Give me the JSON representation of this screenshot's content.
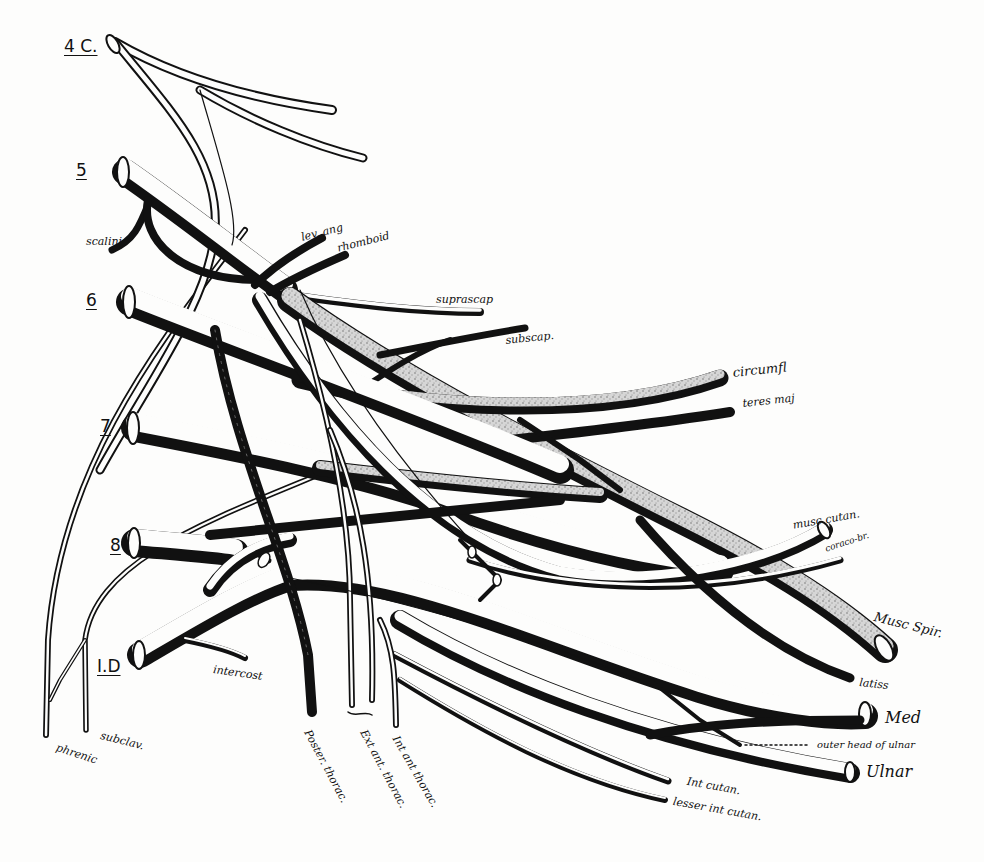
{
  "figure": {
    "colors": {
      "ink": "#111111",
      "paper": "#fdfdfc",
      "stipple": "#b8b8b8"
    }
  },
  "roots": [
    {
      "id": "c4",
      "label": "4 C."
    },
    {
      "id": "c5",
      "label": "5"
    },
    {
      "id": "c6",
      "label": "6"
    },
    {
      "id": "c7",
      "label": "7"
    },
    {
      "id": "c8",
      "label": "8"
    },
    {
      "id": "t1",
      "label": "I.D"
    }
  ],
  "labels": {
    "scaleni": "scalini",
    "lev_ang": "lev. ang",
    "rhomboid": "rhomboid",
    "suprascap": "suprascap",
    "subscap": "subscap.",
    "circumf": "circumfl",
    "teres_maj": "teres maj",
    "musc_cutan": "musc cutan.",
    "coraco_br": "coraco-br.",
    "musc_spir": "Musc Spir.",
    "latiss": "latiss",
    "med": "Med",
    "outer_head_ulnar": "outer head of ulnar",
    "ulnar": "Ulnar",
    "int_cutan": "Int cutan.",
    "lesser_int_cutan": "lesser int cutan.",
    "poster_thorac": "Poster. thorac.",
    "ext_ant_thorac": "Ext ant. thorac.",
    "int_ant_thorac": "Int ant thorac.",
    "intercost": "intercost",
    "subclav": "subclav.",
    "phrenic": "phrenic"
  }
}
